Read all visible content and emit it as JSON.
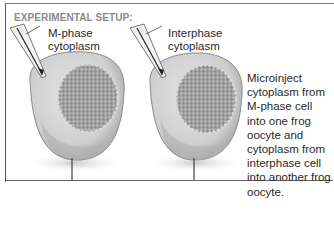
{
  "figure": {
    "section_title": "EXPERIMENTAL SETUP:",
    "left_cell": {
      "label_line1": "M-phase",
      "label_line2": "cytoplasm"
    },
    "right_cell": {
      "label_line1": "Interphase",
      "label_line2": "cytoplasm"
    },
    "description": "Microinject cytoplasm from M-phase cell into one frog oocyte and cytoplasm from interphase cell into another frog oocyte."
  },
  "colors": {
    "title_gray": "#8a8a8a",
    "text": "#2a2a2a",
    "oocyte_fill": "#c9c9c9",
    "nucleus_fill": "#9a9a9a",
    "frame": "#666666"
  }
}
